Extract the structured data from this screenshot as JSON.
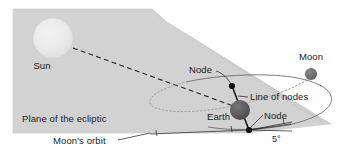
{
  "figure": {
    "type": "astronomy-diagram",
    "background_color": "#ffffff"
  },
  "labels": {
    "sun": "Sun",
    "plane_of_the_ecliptic": "Plane of the ecliptic",
    "earth": "Earth",
    "moon": "Moon",
    "node_upper": "Node",
    "node_lower": "Node",
    "line_of_nodes": "Line of nodes",
    "moons_orbit": "Moon's orbit",
    "inclination_angle": "5°"
  },
  "colors": {
    "ecliptic_plane": "#d2d2d2",
    "ecliptic_plane_edge": "#c4c4c4",
    "sun_body": "#e8e8e8",
    "earth_body": "#5a5a5a",
    "moon_body": "#6e6e6e",
    "node_marker": "#101010",
    "orbit_stroke": "#6e6e6e",
    "orbit_hidden_stroke": "#9a9a9a",
    "sun_ray_stroke": "#262626",
    "text": "#1a1a1a"
  },
  "geometry": {
    "sun_center": [
      53,
      38
    ],
    "sun_radius": 20,
    "earth_center": [
      240,
      110
    ],
    "earth_radius": 10,
    "moon_center": [
      311,
      74
    ],
    "moon_radius": 6,
    "node_upper_point": [
      232,
      86
    ],
    "node_lower_point": [
      249,
      130
    ],
    "inclination_degrees": 5
  }
}
